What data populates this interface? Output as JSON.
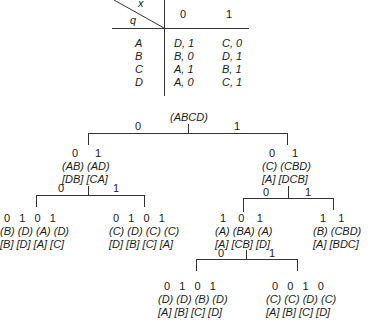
{
  "table": {
    "corner_top": "x",
    "corner_bottom": "q",
    "columns": [
      "0",
      "1"
    ],
    "rows": [
      {
        "state": "A",
        "c0": "D, 1",
        "c1": "C, 0"
      },
      {
        "state": "B",
        "c0": "B, 0",
        "c1": "D, 1"
      },
      {
        "state": "C",
        "c0": "A, 1",
        "c1": "B, 1"
      },
      {
        "state": "D",
        "c0": "A, 0",
        "c1": "C, 1"
      }
    ]
  },
  "tree": {
    "root": "(ABCD)",
    "root_branch0": "0",
    "root_branch1": "1",
    "L": {
      "outs": [
        "0",
        "1"
      ],
      "groups": "(AB) (AD)",
      "succ": "[DB] [CA]",
      "branch0": "0",
      "branch1": "1",
      "LL": {
        "outs": "0   1   0   1",
        "groups": "(B) (D) (A) (D)",
        "succ": "[B] [D] [A] [C]"
      },
      "LR": {
        "outs": "0   1   0   1",
        "groups": "(C) (D) (C) (C)",
        "succ": "[D] [B] [C] [A]"
      }
    },
    "R": {
      "outs": [
        "0",
        "1"
      ],
      "groups": "(C) (CBD)",
      "succ": "[A] [DCB]",
      "branch0": "0",
      "branch1": "1",
      "RL": {
        "outs": "1    0    1",
        "groups": "(A) (BA) (A)",
        "succ": "[A] [CB] [D]",
        "branch0": "0",
        "branch1": "1",
        "RLL": {
          "outs": "0   1   0   1",
          "groups": "(D) (D) (B) (D)",
          "succ": "[A] [B] [C] [D]"
        },
        "RLR": {
          "outs": "0   0   1   0",
          "groups": "(C) (C) (D) (C)",
          "succ": "[A] [B] [C] [D]"
        }
      },
      "RR": {
        "outs": "1    1",
        "groups": "(B) (CBD)",
        "succ": "[A] [BDC]"
      }
    }
  }
}
